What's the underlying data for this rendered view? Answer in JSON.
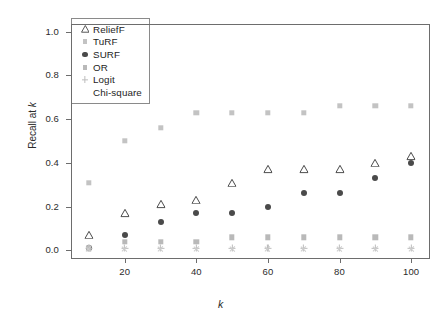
{
  "chart_data": {
    "type": "scatter",
    "title": "",
    "xlabel": "k",
    "ylabel": "Recall at k",
    "xlim": [
      5,
      105
    ],
    "ylim": [
      -0.035,
      1.035
    ],
    "grid": false,
    "legend_position": "top-left",
    "x": [
      10,
      20,
      30,
      40,
      50,
      60,
      70,
      80,
      90,
      100
    ],
    "xticks": [
      "20",
      "40",
      "60",
      "80",
      "100"
    ],
    "xtick_values": [
      20,
      40,
      60,
      80,
      100
    ],
    "yticks": [
      "0.0",
      "0.2",
      "0.4",
      "0.6",
      "0.8",
      "1.0"
    ],
    "ytick_values": [
      0.0,
      0.2,
      0.4,
      0.6,
      0.8,
      1.0
    ],
    "series": [
      {
        "name": "ReliefF",
        "marker": "triangle",
        "color": "#3c3c3c",
        "filled": false,
        "values": [
          0.07,
          0.17,
          0.21,
          0.23,
          0.31,
          0.37,
          0.37,
          0.37,
          0.4,
          0.43
        ]
      },
      {
        "name": "TuRF",
        "marker": "square",
        "color": "#c3c3c3",
        "filled": true,
        "values": [
          0.31,
          0.5,
          0.56,
          0.63,
          0.63,
          0.63,
          0.63,
          0.66,
          0.66,
          0.66
        ]
      },
      {
        "name": "SURF",
        "marker": "circle",
        "color": "#4a4a4a",
        "filled": true,
        "values": [
          0.01,
          0.07,
          0.13,
          0.17,
          0.17,
          0.2,
          0.26,
          0.26,
          0.33,
          0.4
        ]
      },
      {
        "name": "OR",
        "marker": "square",
        "color": "#b9b9b9",
        "filled": true,
        "values": [
          0.01,
          0.04,
          0.04,
          0.04,
          0.06,
          0.06,
          0.06,
          0.06,
          0.06,
          0.06
        ]
      },
      {
        "name": "Logit",
        "marker": "plus",
        "color": "#bdbdbd",
        "filled": true,
        "values": [
          0.01,
          0.01,
          0.01,
          0.01,
          0.01,
          0.01,
          0.01,
          0.01,
          0.01,
          0.01
        ]
      },
      {
        "name": "Chi-square",
        "marker": "cross",
        "color": "#cccccc",
        "filled": true,
        "values": [
          0.005,
          0.005,
          0.005,
          0.005,
          0.005,
          0.005,
          0.005,
          0.005,
          0.005,
          0.005
        ]
      }
    ]
  },
  "legend": {
    "entries": [
      {
        "label": "ReliefF"
      },
      {
        "label": "TuRF"
      },
      {
        "label": "SURF"
      },
      {
        "label": "OR"
      },
      {
        "label": "Logit"
      },
      {
        "label": "Chi-square"
      }
    ]
  },
  "axes": {
    "y_label_text": "Recall at ",
    "y_label_italic": "k",
    "x_label_text": "k"
  }
}
